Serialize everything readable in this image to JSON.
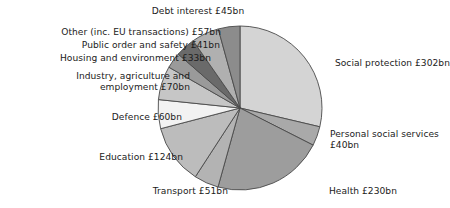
{
  "chart_data": {
    "type": "pie",
    "title": "",
    "unit": "£bn",
    "total": 1013,
    "categories": [
      "Social protection",
      "Personal social services",
      "Health",
      "Transport",
      "Education",
      "Defence",
      "Industry, agriculture and employment",
      "Housing and environment",
      "Public order and safety",
      "Other (inc. EU transactions)",
      "Debt interest"
    ],
    "values": [
      302,
      40,
      230,
      51,
      124,
      60,
      70,
      33,
      41,
      57,
      45
    ],
    "colors": [
      "#d4d4d4",
      "#a9a9a9",
      "#9d9d9d",
      "#b3b3b3",
      "#bcbcbc",
      "#f2f2f2",
      "#c6c6c6",
      "#9a9a9a",
      "#6a6a6a",
      "#b0b0b0",
      "#8c8c8c"
    ],
    "start_angle_deg": 0,
    "direction": "clockwise",
    "legend": "none",
    "grid": false,
    "labels": [
      "Social protection £302bn",
      "Personal social services £40bn",
      "Health £230bn",
      "Transport £51bn",
      "Education £124bn",
      "Defence £60bn",
      "Industry, agriculture and employment £70bn",
      "Housing and environment £33bn",
      "Public order and safety £41bn",
      "Other (inc. EU transactions) £57bn",
      "Debt interest £45bn"
    ]
  },
  "labels": {
    "debt_interest": "Debt interest £45bn",
    "other_eu": "Other (inc. EU transactions) £57bn",
    "public_order": "Public order and safety £41bn",
    "housing": "Housing and environment £33bn",
    "industry_line1": "Industry, agriculture and",
    "industry_line2": "employment £70bn",
    "defence": "Defence £60bn",
    "education": "Education £124bn",
    "transport": "Transport £51bn",
    "health": "Health £230bn",
    "personal_social_line1": "Personal social services",
    "personal_social_line2": "£40bn",
    "social_protection": "Social protection £302bn"
  }
}
